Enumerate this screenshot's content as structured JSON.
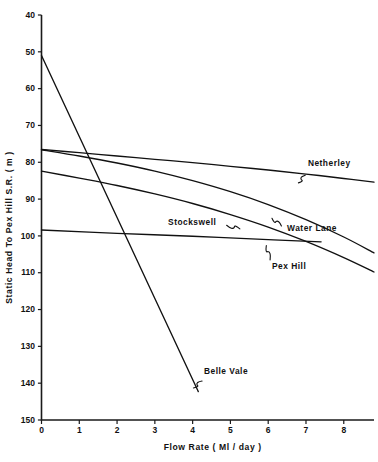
{
  "chart_data": {
    "type": "line",
    "title": "",
    "subtitle": "",
    "xlabel": "Flow  Rate  ( Ml / day )",
    "ylabel": "Static   Head   To   Pex   Hill   S.R.  ( m )",
    "xlim": [
      0,
      8.8
    ],
    "ylim": [
      40,
      150
    ],
    "y_inverted": true,
    "grid": false,
    "legend_position": "inline-annotations",
    "xticks": [
      0,
      1,
      2,
      3,
      4,
      5,
      6,
      7,
      8
    ],
    "xtick_labels": [
      "0",
      "1",
      "2",
      "3",
      "4",
      "5",
      "6",
      "7",
      "8"
    ],
    "yticks": [
      40,
      50,
      60,
      70,
      80,
      90,
      100,
      110,
      120,
      130,
      140,
      150
    ],
    "ytick_labels": [
      "40",
      "50",
      "60",
      "70",
      "80",
      "90",
      "100",
      "110",
      "120",
      "130",
      "140",
      "150"
    ],
    "series": [
      {
        "name": "Netherley",
        "label": "Netherley",
        "label_x": 7.05,
        "label_y": 80.5,
        "leader": {
          "from_x": 6.98,
          "from_y": 83.5,
          "to_x": 6.8,
          "to_y": 85.6
        },
        "points": [
          {
            "x": 0.0,
            "y": 76.5
          },
          {
            "x": 1.0,
            "y": 77.4
          },
          {
            "x": 2.0,
            "y": 78.3
          },
          {
            "x": 3.0,
            "y": 79.2
          },
          {
            "x": 4.0,
            "y": 80.1
          },
          {
            "x": 5.0,
            "y": 81.1
          },
          {
            "x": 6.0,
            "y": 82.1
          },
          {
            "x": 7.0,
            "y": 83.2
          },
          {
            "x": 8.0,
            "y": 84.4
          },
          {
            "x": 8.8,
            "y": 85.4
          }
        ]
      },
      {
        "name": "Water Lane",
        "label": "Water  Lane",
        "label_x": 6.5,
        "label_y": 98.0,
        "leader": {
          "from_x": 6.35,
          "from_y": 97.3,
          "to_x": 6.1,
          "to_y": 95.2
        },
        "points": [
          {
            "x": 0.0,
            "y": 76.6
          },
          {
            "x": 1.0,
            "y": 78.3
          },
          {
            "x": 2.0,
            "y": 80.2
          },
          {
            "x": 3.0,
            "y": 82.4
          },
          {
            "x": 4.0,
            "y": 85.0
          },
          {
            "x": 5.0,
            "y": 88.0
          },
          {
            "x": 6.0,
            "y": 91.5
          },
          {
            "x": 7.0,
            "y": 95.6
          },
          {
            "x": 8.0,
            "y": 100.3
          },
          {
            "x": 8.8,
            "y": 104.6
          }
        ]
      },
      {
        "name": "Pex Hill",
        "label": "Pex  Hill",
        "label_x": 6.1,
        "label_y": 108.5,
        "leader": {
          "from_x": 6.05,
          "from_y": 106.5,
          "to_x": 5.95,
          "to_y": 102.6
        },
        "points": [
          {
            "x": 0.0,
            "y": 82.4
          },
          {
            "x": 1.0,
            "y": 84.3
          },
          {
            "x": 2.0,
            "y": 86.3
          },
          {
            "x": 3.0,
            "y": 88.6
          },
          {
            "x": 4.0,
            "y": 91.2
          },
          {
            "x": 5.0,
            "y": 94.2
          },
          {
            "x": 6.0,
            "y": 97.6
          },
          {
            "x": 7.0,
            "y": 101.5
          },
          {
            "x": 8.0,
            "y": 105.9
          },
          {
            "x": 8.8,
            "y": 109.8
          }
        ]
      },
      {
        "name": "Stockswell",
        "label": "Stockswell",
        "label_x": 3.35,
        "label_y": 96.5,
        "leader": {
          "from_x": 4.9,
          "from_y": 97.1,
          "to_x": 5.25,
          "to_y": 98.1
        },
        "points": [
          {
            "x": 0.0,
            "y": 98.4
          },
          {
            "x": 2.0,
            "y": 99.3
          },
          {
            "x": 4.0,
            "y": 100.1
          },
          {
            "x": 6.0,
            "y": 101.0
          },
          {
            "x": 7.4,
            "y": 101.6
          }
        ]
      },
      {
        "name": "Belle Vale",
        "label": "Belle  Vale",
        "label_x": 4.3,
        "label_y": 137.0,
        "leader": {
          "from_x": 4.25,
          "from_y": 139.4,
          "to_x": 4.02,
          "to_y": 141.3
        },
        "points": [
          {
            "x": 0.0,
            "y": 51.0
          },
          {
            "x": 1.0,
            "y": 73.0
          },
          {
            "x": 2.0,
            "y": 95.0
          },
          {
            "x": 3.0,
            "y": 117.0
          },
          {
            "x": 4.0,
            "y": 139.0
          },
          {
            "x": 4.15,
            "y": 142.3
          }
        ]
      }
    ]
  }
}
